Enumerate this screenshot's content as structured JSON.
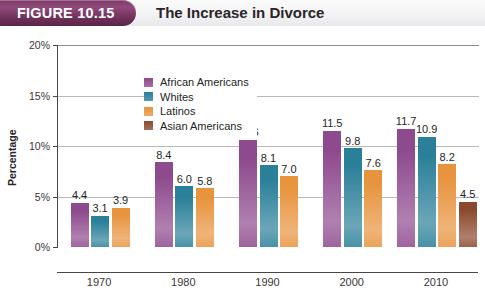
{
  "header": {
    "figure_tab_label": "FIGURE 10.15",
    "title": "The Increase in Divorce",
    "tab_color": "#7c3a66"
  },
  "chart_data": {
    "type": "bar",
    "title": "The Increase in Divorce",
    "xlabel": "The Percentage of Americans Who Are Divorced",
    "ylabel": "Percentage",
    "categories": [
      "1970",
      "1980",
      "1990",
      "2000",
      "2010"
    ],
    "ylim": [
      0,
      20
    ],
    "ytick_labels": [
      "0%",
      "5%",
      "10%",
      "15%",
      "20%"
    ],
    "ytick_values": [
      0,
      5,
      10,
      15,
      20
    ],
    "grid": true,
    "legend_position": "upper-left-inside",
    "series": [
      {
        "name": "African Americans",
        "color": "#8e4a8e",
        "values": [
          4.4,
          8.4,
          10.6,
          11.5,
          11.7
        ],
        "labels": [
          "4.4",
          "8.4",
          "10.6",
          "11.5",
          "11.7"
        ]
      },
      {
        "name": "Whites",
        "color": "#2b8099",
        "values": [
          3.1,
          6.0,
          8.1,
          9.8,
          10.9
        ],
        "labels": [
          "3.1",
          "6.0",
          "8.1",
          "9.8",
          "10.9"
        ]
      },
      {
        "name": "Latinos",
        "color": "#e8943f",
        "values": [
          3.9,
          5.8,
          7.0,
          7.6,
          8.2
        ],
        "labels": [
          "3.9",
          "5.8",
          "7.0",
          "7.6",
          "8.2"
        ]
      },
      {
        "name": "Asian Americans",
        "color": "#8b4a2f",
        "values": [
          null,
          null,
          null,
          null,
          4.5
        ],
        "labels": [
          "",
          "",
          "",
          "",
          "4.5"
        ]
      }
    ]
  }
}
